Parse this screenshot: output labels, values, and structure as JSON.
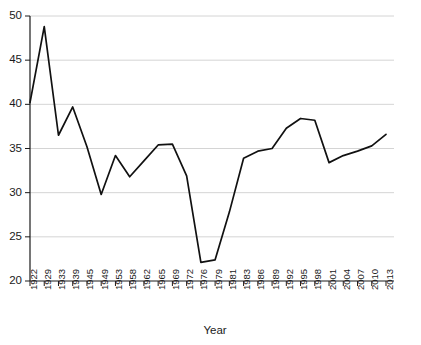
{
  "chart_data": {
    "type": "line",
    "title": "",
    "xlabel": "Year",
    "ylabel": "",
    "ylim": [
      20,
      50
    ],
    "yticks": [
      20,
      25,
      30,
      35,
      40,
      45,
      50
    ],
    "grid": true,
    "legend": "none",
    "categories": [
      "1922",
      "1929",
      "1933",
      "1939",
      "1945",
      "1949",
      "1953",
      "1958",
      "1962",
      "1965",
      "1969",
      "1972",
      "1976",
      "1979",
      "1981",
      "1983",
      "1986",
      "1989",
      "1992",
      "1995",
      "1998",
      "2001",
      "2004",
      "2007",
      "2010",
      "2013"
    ],
    "values": [
      40.2,
      48.8,
      36.5,
      39.7,
      35.2,
      29.8,
      34.2,
      31.8,
      33.6,
      35.4,
      35.5,
      31.9,
      22.1,
      22.4,
      27.8,
      33.9,
      34.7,
      35.0,
      37.3,
      38.4,
      38.2,
      33.4,
      34.2,
      34.7,
      35.3,
      36.6
    ]
  },
  "axis": {
    "x_title": "Year",
    "y_tick_labels": [
      "50",
      "45",
      "40",
      "35",
      "30",
      "25",
      "20"
    ]
  }
}
